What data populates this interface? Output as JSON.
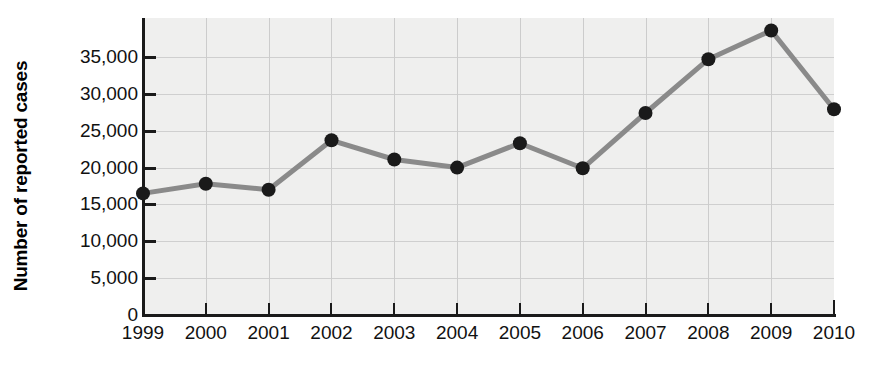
{
  "chart_data": {
    "type": "line",
    "title": "",
    "xlabel": "",
    "ylabel": "Number of reported cases",
    "categories": [
      "1999",
      "2000",
      "2001",
      "2002",
      "2003",
      "2004",
      "2005",
      "2006",
      "2007",
      "2008",
      "2009",
      "2010"
    ],
    "values": [
      16500,
      17800,
      17000,
      23700,
      21100,
      20000,
      23300,
      19900,
      27400,
      34700,
      38600,
      27900
    ],
    "series": [
      {
        "name": "Number of reported cases",
        "values": [
          16500,
          17800,
          17000,
          23700,
          21100,
          20000,
          23300,
          19900,
          27400,
          34700,
          38600,
          27900
        ]
      }
    ],
    "ylim": [
      0,
      40000
    ],
    "ytick_values": [
      0,
      5000,
      10000,
      15000,
      20000,
      25000,
      30000,
      35000
    ],
    "ytick_labels": [
      "0",
      "5,000",
      "10,000",
      "15,000",
      "20,000",
      "25,000",
      "30,000",
      "35,000"
    ],
    "grid": true,
    "legend": false,
    "legend_position": "none",
    "marker": "circle",
    "colors": {
      "line": "#8a8a8a",
      "marker": "#1a1a1a",
      "plot_background": "#efefee",
      "gridline": "#cfcfcf",
      "axis": "#1a1a1a",
      "text": "#111111"
    }
  }
}
